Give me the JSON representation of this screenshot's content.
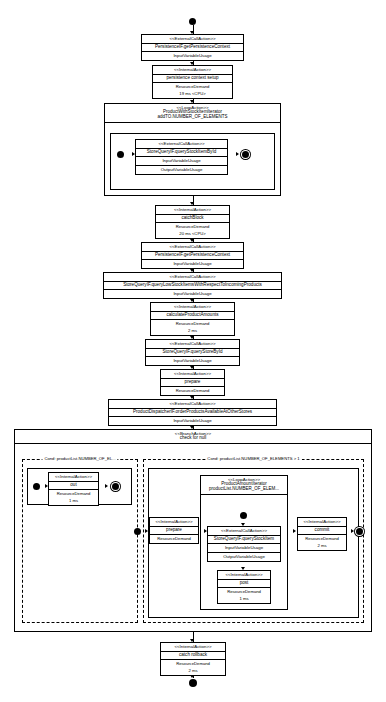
{
  "diagram": {
    "stereotypes": {
      "external": "<<ExternalCallAction>>",
      "internal": "<<InternalAction>>",
      "loop": "<<LoopAction>>",
      "branch": "<<BranchAction>>"
    },
    "labels": {
      "input_variable_usage": "InputVariableUsage",
      "output_variable_usage": "OutputVariableUsage",
      "resource_demand": "ResourceDemand"
    },
    "nodes": {
      "get_persistence_context_1": {
        "stereotype": "<<ExternalCallAction>>",
        "name": "PersistenceIF.getPersistenceContext",
        "input": "InputVariableUsage"
      },
      "persistence_context_setup": {
        "stereotype": "<<InternalAction>>",
        "name": "persistence context setup",
        "demand_label": "ResourceDemand",
        "demand": "19 ms <CPU>"
      },
      "loop_product_with_stock_item": {
        "stereotype": "<<LoopAction>>",
        "name": "ProductWithStockItemIterator",
        "count": "addTO.NUMBER_OF_ELEMENTS"
      },
      "query_stock_item_by_id": {
        "stereotype": "<<ExternalCallAction>>",
        "name": "StoreQueryIF.queryStockItemById",
        "input": "InputVariableUsage",
        "output": "OutputVariableUsage"
      },
      "catch_block": {
        "stereotype": "<<InternalAction>>",
        "name": "catchBlock",
        "demand_label": "ResourceDemand",
        "demand": "20 ms <CPU>"
      },
      "get_persistence_context_2": {
        "stereotype": "<<ExternalCallAction>>",
        "name": "PersistenceIF.getPersistenceContext",
        "input": "InputVariableUsage"
      },
      "query_low_stock_items": {
        "stereotype": "<<ExternalCallAction>>",
        "name": "StoreQueryIF.queryLowStockItemsWithRespectToIncomingProducts",
        "input": "InputVariableUsage"
      },
      "calculate_product_amounts": {
        "stereotype": "<<InternalAction>>",
        "name": "calculateProductAmounts",
        "demand_label": "ResourceDemand",
        "demand": "2 ms"
      },
      "query_store_by_id": {
        "stereotype": "<<ExternalCallAction>>",
        "name": "StoreQueryIF.queryStoreById",
        "input": "InputVariableUsage"
      },
      "prepare_outer": {
        "stereotype": "<<InternalAction>>",
        "name": "prepare",
        "demand_label": "ResourceDemand"
      },
      "order_products_available": {
        "stereotype": "<<ExternalCallAction>>",
        "name": "ProductDispatcherIF.orderProductsAvailableAtOtherStores",
        "input": "InputVariableUsage"
      },
      "branch_check_for_null": {
        "stereotype": "<<BranchAction>>",
        "name": "check for null"
      },
      "guard_left": {
        "condition": "Cond: productList.NUMBER_OF_EL... "
      },
      "guard_right": {
        "condition": "Cond: productList.NUMBER_OF_ELEMENTS > 1"
      },
      "out_action": {
        "stereotype": "<<InternalAction>>",
        "name": "out",
        "demand_label": "ResourceDemand",
        "demand": "1 ms"
      },
      "prepare_inner": {
        "stereotype": "<<InternalAction>>",
        "name": "prepare",
        "demand_label": "ResourceDemand"
      },
      "loop_product_amount": {
        "stereotype": "<<LoopAction>>",
        "name": "ProductAmountIterator",
        "count": "productList.NUMBER_OF_ELEM..."
      },
      "query_stock_item": {
        "stereotype": "<<ExternalCallAction>>",
        "name": "StoreQueryIF.queryStockItem",
        "input": "InputVariableUsage",
        "output": "OutputVariableUsage"
      },
      "post_action": {
        "stereotype": "<<InternalAction>>",
        "name": "post",
        "demand_label": "ResourceDemand",
        "demand": "1 ms"
      },
      "commit_action": {
        "stereotype": "<<InternalAction>>",
        "name": "commit",
        "demand_label": "ResourceDemand",
        "demand": "2 ms"
      },
      "catch_rollback": {
        "stereotype": "<<InternalAction>>",
        "name": "catch rollback",
        "demand_label": "ResourceDemand",
        "demand": "2 ms"
      }
    }
  }
}
